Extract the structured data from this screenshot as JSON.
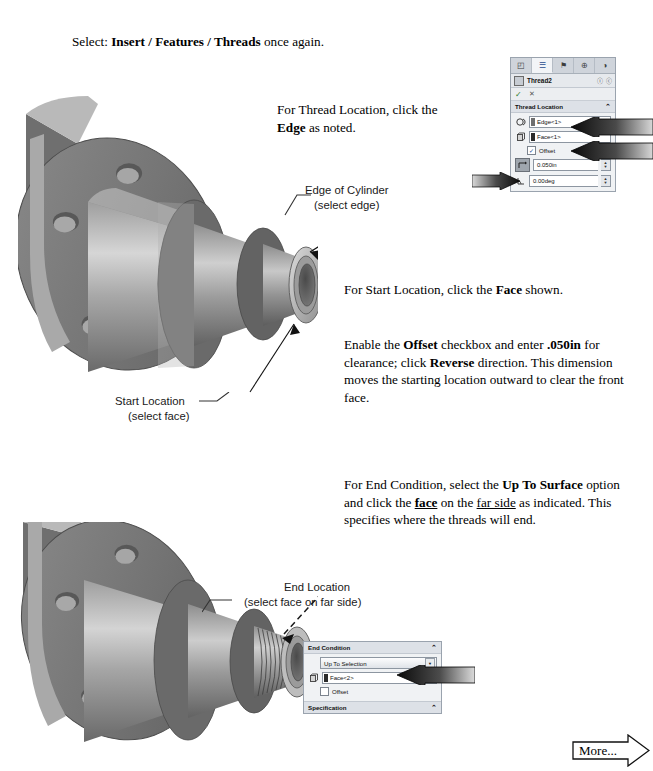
{
  "page": {
    "intro": {
      "prefix": "Select: ",
      "bold1": "Insert / Features / Threads",
      "suffix": " once again."
    },
    "paragraphs": {
      "thread_location": {
        "line1_a": "For Thread Location, click the",
        "line2_bold": "Edge",
        "line2_b": " as noted."
      },
      "start_location": {
        "a": "For Start Location, click the ",
        "bold": "Face",
        "b": " shown."
      },
      "offset": {
        "a": "Enable the ",
        "bold1": "Offset",
        "b": " checkbox and enter ",
        "bold2": ".050in",
        "c": " for clearance; click ",
        "bold3": "Reverse",
        "d": " direction. This dimension moves the starting location outward to clear the front face."
      },
      "end_condition": {
        "a": "For End Condition, select the ",
        "bold1": "Up To Surface",
        "b": " option and click the ",
        "underline1": "face",
        "c": " on the ",
        "underline2": "far side",
        "d": " as indicated. This specifies where the threads will end."
      }
    },
    "callouts": {
      "edge_of_cylinder": {
        "title": "Edge of Cylinder",
        "sub": "(select edge)"
      },
      "start_location": {
        "title": "Start Location",
        "sub": "(select face)"
      },
      "end_location": {
        "title": "End Location",
        "sub": "(select face on far side)"
      }
    },
    "more_button": {
      "label": "More..."
    }
  },
  "property_manager_top": {
    "tabs": [
      {
        "name": "feature-manager-tab",
        "glyph": "◰"
      },
      {
        "name": "property-manager-tab",
        "glyph": "☰"
      },
      {
        "name": "configuration-manager-tab",
        "glyph": "⚑"
      },
      {
        "name": "dimxpert-manager-tab",
        "glyph": "⊕"
      },
      {
        "name": "display-manager-tab",
        "glyph": "◑"
      }
    ],
    "title": "Thread2",
    "title_icons": [
      "ⓘ",
      "ⓒ"
    ],
    "accept_glyph": "✓",
    "cancel_glyph": "✕",
    "section_thread_location": {
      "label": "Thread Location",
      "collapse_glyph": "⌃",
      "edge_field": {
        "icon_name": "edge-selection-icon",
        "value": "Edge<1>"
      },
      "face_field": {
        "icon_name": "face-selection-icon",
        "value": "Face<1>"
      },
      "offset_checkbox": {
        "label": "Offset",
        "checked": true
      },
      "reverse_button_name": "reverse-direction-button",
      "offset_value": "0.050in",
      "angle_value": "0.00deg"
    }
  },
  "property_manager_bottom": {
    "section_end_condition": {
      "label": "End Condition",
      "collapse_glyph": "⌃",
      "combo_value": "Up To Selection",
      "combo_arrow": "▼",
      "face_field": {
        "icon_name": "face-selection-icon",
        "value": "Face<2>"
      },
      "offset_checkbox": {
        "label": "Offset",
        "checked": false
      }
    },
    "section_specification": {
      "label": "Specification",
      "collapse_glyph": "⌃"
    }
  },
  "colors": {
    "panel_bg": "#f0f2f4",
    "panel_header": "#dde1e7",
    "arrow_dark": "#111111",
    "model_mid": "#7b7b7b",
    "model_light": "#c9c9c9",
    "model_dark": "#5a5a5a"
  }
}
